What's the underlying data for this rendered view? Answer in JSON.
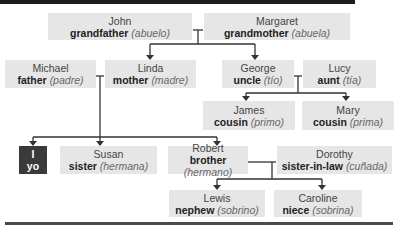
{
  "diagram": {
    "people": [
      {
        "id": "john",
        "name": "John",
        "relation": "grandfather",
        "spanish": "(abuelo)"
      },
      {
        "id": "margaret",
        "name": "Margaret",
        "relation": "grandmother",
        "spanish": "(abuela)"
      },
      {
        "id": "michael",
        "name": "Michael",
        "relation": "father",
        "spanish": "(padre)"
      },
      {
        "id": "linda",
        "name": "Linda",
        "relation": "mother",
        "spanish": "(madre)"
      },
      {
        "id": "george",
        "name": "George",
        "relation": "uncle",
        "spanish": "(tío)"
      },
      {
        "id": "lucy",
        "name": "Lucy",
        "relation": "aunt",
        "spanish": "(tía)"
      },
      {
        "id": "james",
        "name": "James",
        "relation": "cousin",
        "spanish": "(primo)"
      },
      {
        "id": "mary",
        "name": "Mary",
        "relation": "cousin",
        "spanish": "(prima)"
      },
      {
        "id": "me",
        "name": "I",
        "relation": "yo",
        "spanish": ""
      },
      {
        "id": "susan",
        "name": "Susan",
        "relation": "sister",
        "spanish": "(hermana)"
      },
      {
        "id": "robert",
        "name": "Robert",
        "relation": "brother",
        "spanish": "(hermano)"
      },
      {
        "id": "dorothy",
        "name": "Dorothy",
        "relation": "sister-in-law",
        "spanish": "(cuñada)"
      },
      {
        "id": "lewis",
        "name": "Lewis",
        "relation": "nephew",
        "spanish": "(sobrino)"
      },
      {
        "id": "caroline",
        "name": "Caroline",
        "relation": "niece",
        "spanish": "(sobrina)"
      }
    ],
    "colors": {
      "box": "#e6e6e6",
      "self_box": "#3a3a3a",
      "line": "#333333",
      "bar": "#1c1c1c"
    }
  }
}
